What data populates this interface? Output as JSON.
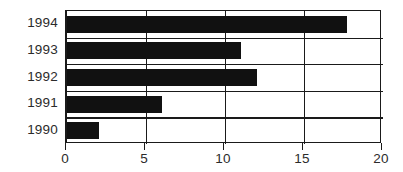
{
  "chart_data": {
    "type": "bar",
    "orientation": "horizontal",
    "title": "",
    "xlabel": "",
    "ylabel": "",
    "categories": [
      "1994",
      "1993",
      "1992",
      "1991",
      "1990"
    ],
    "values": [
      17.7,
      11,
      12,
      6,
      2
    ],
    "series": [
      {
        "name": "",
        "values": [
          17.7,
          11,
          12,
          6,
          2
        ]
      }
    ],
    "xlim": [
      0,
      20
    ],
    "xticks": [
      0,
      5,
      10,
      15,
      20
    ],
    "xtick_labels": [
      "0",
      "5",
      "10",
      "15",
      "20"
    ],
    "grid": "vertical-and-row-separators",
    "legend": "none",
    "bar_color": "#111111",
    "axis_color": "#1a1a1a",
    "background_color": "#ffffff",
    "label_color": "#2b2b2b"
  }
}
